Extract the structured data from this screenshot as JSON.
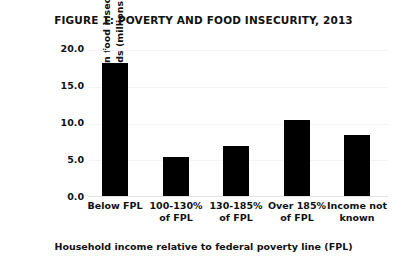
{
  "chart_data": {
    "type": "bar",
    "title": "FIGURE 1: POVERTY AND FOOD INSECURITY, 2013",
    "xlabel": "Household income relative to federal poverty line (FPL)",
    "ylabel": "Individuals in food insecure households (millions)",
    "ylabel_lines": [
      "Individuals in food insecure",
      "households (millions)"
    ],
    "categories": [
      "Below FPL",
      "100-130% of FPL",
      "130-185% of FPL",
      "Over 185% of FPL",
      "Income not known"
    ],
    "category_lines": [
      [
        "Below FPL"
      ],
      [
        "100-130%",
        "of FPL"
      ],
      [
        "130-185%",
        "of FPL"
      ],
      [
        "Over 185%",
        "of FPL"
      ],
      [
        "Income not",
        "known"
      ]
    ],
    "values": [
      18.3,
      5.4,
      6.9,
      10.5,
      8.4
    ],
    "ylim": [
      0.0,
      20.0
    ],
    "ytick_values": [
      0.0,
      5.0,
      10.0,
      15.0,
      20.0
    ],
    "ytick_labels": [
      "0.0",
      "5.0",
      "10.0",
      "15.0",
      "20.0"
    ],
    "grid": true,
    "legend": "none",
    "bar_color": "#000000",
    "grid_color": "#f4f4f4",
    "background_color": "#ffffff",
    "text_color": "#111111"
  }
}
